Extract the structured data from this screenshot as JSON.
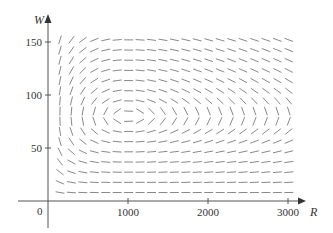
{
  "chart_data": {
    "type": "direction_field",
    "title": "",
    "xlabel": "R",
    "ylabel": "W",
    "xlim": [
      0,
      3000
    ],
    "ylim": [
      0,
      150
    ],
    "x_ticks": [
      1000,
      2000,
      3000
    ],
    "x_tick_labels": [
      "1000",
      "2000",
      "3000"
    ],
    "y_ticks": [
      50,
      100,
      150
    ],
    "y_tick_labels": [
      "50",
      "100",
      "150"
    ],
    "origin_label": "0",
    "grid": false,
    "legend": null,
    "system": {
      "dR_dt": "0.08*R - 0.001*R*W",
      "dW_dt": "-0.02*W + 0.00002*R*W",
      "equilibrium": {
        "R": 1000,
        "W": 80
      }
    },
    "field_grid": {
      "R_start": 150,
      "R_step": 143,
      "R_count": 21,
      "W_start": 8,
      "W_step": 9.6,
      "W_count": 16
    }
  },
  "colors": {
    "axis": "#555555",
    "segment": "#7a7a7a",
    "text": "#333333"
  },
  "layout": {
    "x0_px": 48,
    "px_per_R": 0.08,
    "y0_px": 201,
    "px_per_W": 1.06,
    "segment_len_px": 9
  }
}
